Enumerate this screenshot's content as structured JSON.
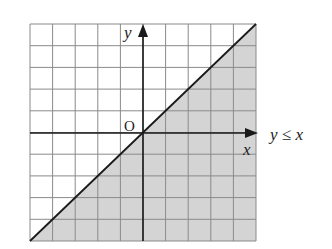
{
  "chart_data": {
    "type": "inequality-region",
    "title": "",
    "inequality": "y ≤ x",
    "boundary_line": {
      "equation": "y = x",
      "style": "solid"
    },
    "shaded_region": "below line (y ≤ x)",
    "grid": true,
    "grid_cells": {
      "x": 10,
      "y": 10
    },
    "xlim": [
      -5,
      5
    ],
    "ylim": [
      -5,
      5
    ],
    "xlabel": "x",
    "ylabel": "y",
    "origin_label": "O",
    "annotation": "y ≤ x",
    "colors": {
      "shade": "#d4d4d4",
      "grid": "#8a8a8a",
      "axis": "#1a1a1a",
      "line": "#1a1a1a"
    }
  },
  "labels": {
    "x_axis": "x",
    "y_axis": "y",
    "origin": "O",
    "inequality": "y ≤ x"
  }
}
